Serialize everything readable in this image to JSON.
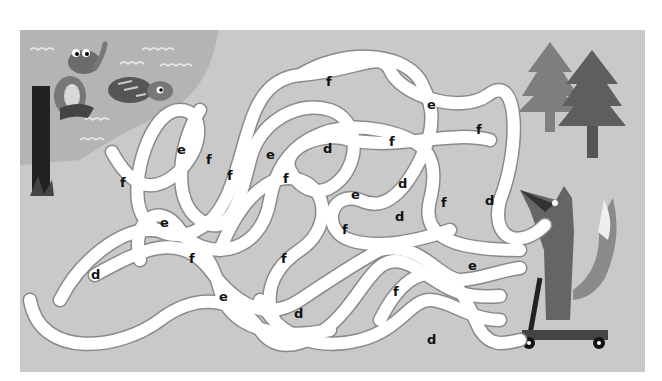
{
  "puzzle": {
    "type": "letter-maze",
    "background_color": "#c9c9c9",
    "pond_color": "#b3b3b3",
    "path_color": "#ffffff",
    "start_character": "frog-on-post",
    "end_character": "fox-on-scooter",
    "letters": [
      {
        "char": "f",
        "x": 330,
        "y": 82
      },
      {
        "char": "e",
        "x": 431,
        "y": 105
      },
      {
        "char": "f",
        "x": 480,
        "y": 130
      },
      {
        "char": "e",
        "x": 181,
        "y": 150
      },
      {
        "char": "f",
        "x": 210,
        "y": 160
      },
      {
        "char": "e",
        "x": 270,
        "y": 155
      },
      {
        "char": "d",
        "x": 327,
        "y": 149
      },
      {
        "char": "f",
        "x": 393,
        "y": 142
      },
      {
        "char": "f",
        "x": 124,
        "y": 183
      },
      {
        "char": "f",
        "x": 231,
        "y": 176
      },
      {
        "char": "f",
        "x": 287,
        "y": 179
      },
      {
        "char": "e",
        "x": 355,
        "y": 195
      },
      {
        "char": "d",
        "x": 402,
        "y": 184
      },
      {
        "char": "f",
        "x": 445,
        "y": 203
      },
      {
        "char": "d",
        "x": 489,
        "y": 201
      },
      {
        "char": "d",
        "x": 399,
        "y": 217
      },
      {
        "char": "f",
        "x": 346,
        "y": 230
      },
      {
        "char": "e",
        "x": 164,
        "y": 223
      },
      {
        "char": "f",
        "x": 193,
        "y": 259
      },
      {
        "char": "f",
        "x": 285,
        "y": 259
      },
      {
        "char": "e",
        "x": 472,
        "y": 266
      },
      {
        "char": "d",
        "x": 95,
        "y": 275
      },
      {
        "char": "e",
        "x": 223,
        "y": 297
      },
      {
        "char": "f",
        "x": 397,
        "y": 292
      },
      {
        "char": "d",
        "x": 298,
        "y": 314
      },
      {
        "char": "d",
        "x": 431,
        "y": 340
      }
    ]
  }
}
